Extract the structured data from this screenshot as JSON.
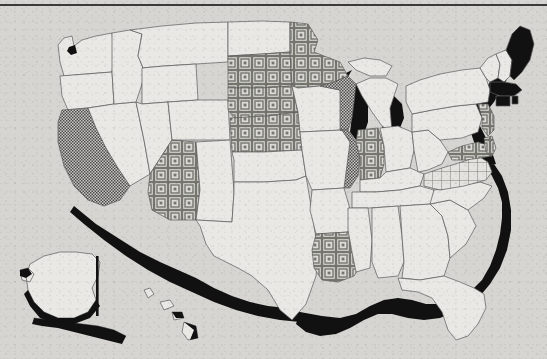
{
  "document": {
    "type": "printed-map",
    "title": "United States choropleth map",
    "background_color": "#d6d5d2",
    "rule_color": "#3b3b3b",
    "border_color": "#5a5a5a"
  },
  "legend": {
    "patterns": [
      {
        "key": "none",
        "label": "No fill (white / light)",
        "color": "#e9e8e5"
      },
      {
        "key": "stipple",
        "label": "Fine dotted stipple",
        "color": "#8c8c8a"
      },
      {
        "key": "squares",
        "label": "Concentric squares",
        "color": "#9a9a97"
      },
      {
        "key": "grid",
        "label": "Grid crosshatch",
        "color": "#b9b9b6"
      },
      {
        "key": "solid",
        "label": "Solid black",
        "color": "#111111"
      }
    ]
  },
  "map_data": {
    "type": "choropleth",
    "projection": "albers-usa",
    "coast_shadow_color": "#111111",
    "states": [
      {
        "code": "WA",
        "name": "Washington",
        "pattern": "none"
      },
      {
        "code": "OR",
        "name": "Oregon",
        "pattern": "none"
      },
      {
        "code": "CA",
        "name": "California",
        "pattern": "stipple"
      },
      {
        "code": "NV",
        "name": "Nevada",
        "pattern": "none"
      },
      {
        "code": "ID",
        "name": "Idaho",
        "pattern": "none"
      },
      {
        "code": "MT",
        "name": "Montana",
        "pattern": "none"
      },
      {
        "code": "WY",
        "name": "Wyoming",
        "pattern": "none"
      },
      {
        "code": "UT",
        "name": "Utah",
        "pattern": "none"
      },
      {
        "code": "AZ",
        "name": "Arizona",
        "pattern": "squares"
      },
      {
        "code": "NM",
        "name": "New Mexico",
        "pattern": "none"
      },
      {
        "code": "CO",
        "name": "Colorado",
        "pattern": "none"
      },
      {
        "code": "ND",
        "name": "North Dakota",
        "pattern": "none"
      },
      {
        "code": "SD",
        "name": "South Dakota",
        "pattern": "squares"
      },
      {
        "code": "NE",
        "name": "Nebraska",
        "pattern": "squares"
      },
      {
        "code": "KS",
        "name": "Kansas",
        "pattern": "squares"
      },
      {
        "code": "OK",
        "name": "Oklahoma",
        "pattern": "none"
      },
      {
        "code": "TX",
        "name": "Texas",
        "pattern": "none"
      },
      {
        "code": "MN",
        "name": "Minnesota",
        "pattern": "squares"
      },
      {
        "code": "IA",
        "name": "Iowa",
        "pattern": "none"
      },
      {
        "code": "MO",
        "name": "Missouri",
        "pattern": "none"
      },
      {
        "code": "AR",
        "name": "Arkansas",
        "pattern": "none"
      },
      {
        "code": "LA",
        "name": "Louisiana",
        "pattern": "squares"
      },
      {
        "code": "WI",
        "name": "Wisconsin",
        "pattern": "stipple"
      },
      {
        "code": "IL",
        "name": "Illinois",
        "pattern": "stipple"
      },
      {
        "code": "MI",
        "name": "Michigan",
        "pattern": "none"
      },
      {
        "code": "IN",
        "name": "Indiana",
        "pattern": "squares"
      },
      {
        "code": "OH",
        "name": "Ohio",
        "pattern": "none"
      },
      {
        "code": "KY",
        "name": "Kentucky",
        "pattern": "none"
      },
      {
        "code": "TN",
        "name": "Tennessee",
        "pattern": "none"
      },
      {
        "code": "MS",
        "name": "Mississippi",
        "pattern": "none"
      },
      {
        "code": "AL",
        "name": "Alabama",
        "pattern": "none"
      },
      {
        "code": "GA",
        "name": "Georgia",
        "pattern": "none"
      },
      {
        "code": "FL",
        "name": "Florida",
        "pattern": "none"
      },
      {
        "code": "SC",
        "name": "South Carolina",
        "pattern": "none"
      },
      {
        "code": "NC",
        "name": "North Carolina",
        "pattern": "none"
      },
      {
        "code": "VA",
        "name": "Virginia",
        "pattern": "grid"
      },
      {
        "code": "WV",
        "name": "West Virginia",
        "pattern": "none"
      },
      {
        "code": "MD",
        "name": "Maryland",
        "pattern": "squares"
      },
      {
        "code": "DE",
        "name": "Delaware",
        "pattern": "squares"
      },
      {
        "code": "PA",
        "name": "Pennsylvania",
        "pattern": "none"
      },
      {
        "code": "NJ",
        "name": "New Jersey",
        "pattern": "squares"
      },
      {
        "code": "NY",
        "name": "New York",
        "pattern": "none"
      },
      {
        "code": "CT",
        "name": "Connecticut",
        "pattern": "solid"
      },
      {
        "code": "RI",
        "name": "Rhode Island",
        "pattern": "solid"
      },
      {
        "code": "MA",
        "name": "Massachusetts",
        "pattern": "solid"
      },
      {
        "code": "VT",
        "name": "Vermont",
        "pattern": "none"
      },
      {
        "code": "NH",
        "name": "New Hampshire",
        "pattern": "none"
      },
      {
        "code": "ME",
        "name": "Maine",
        "pattern": "solid"
      },
      {
        "code": "AK",
        "name": "Alaska",
        "pattern": "none"
      },
      {
        "code": "HI",
        "name": "Hawaii",
        "pattern": "none"
      }
    ],
    "inset_divider": {
      "name": "alaska-inset-divider",
      "orientation": "vertical"
    },
    "counts": {
      "none": 33,
      "stipple": 3,
      "squares": 9,
      "grid": 1,
      "solid": 4,
      "total": 50
    }
  }
}
